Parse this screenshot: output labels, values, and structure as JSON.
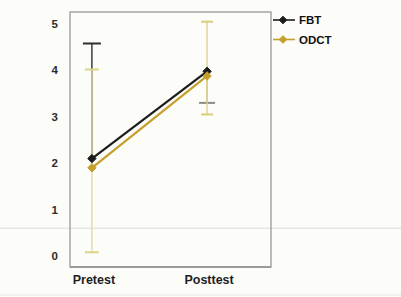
{
  "figure": {
    "kind": "scanned line chart with error bars",
    "background_color": "#fcfcf9",
    "plot_border_color": "#909090"
  },
  "chart_data": {
    "type": "line",
    "title": "",
    "xlabel": "",
    "ylabel": "",
    "categories": [
      "Pretest",
      "Posttest"
    ],
    "series": [
      {
        "name": "FBT",
        "color": "#1c1c1c",
        "marker": "diamond",
        "values": [
          2.1,
          3.98
        ]
      },
      {
        "name": "ODCT",
        "color": "#c49f2b",
        "marker": "diamond",
        "values": [
          1.9,
          3.88
        ]
      }
    ],
    "error_bars": [
      {
        "series": "FBT",
        "category_index": 0,
        "from": 2.1,
        "to": 4.58,
        "caps": [
          "to"
        ],
        "line_color": "#2e2e2e",
        "cap_color": "#2e2e2e",
        "cap_width": 18
      },
      {
        "series": "ODCT",
        "category_index": 0,
        "from": 0.08,
        "to": 4.02,
        "caps": [
          "from",
          "to"
        ],
        "line_color": "#e2db9e",
        "cap_color": "#ddd489",
        "cap_width": 14
      },
      {
        "series": "FBT",
        "category_index": 1,
        "from": 3.3,
        "to": 3.98,
        "caps": [
          "from"
        ],
        "line_color": "#bdb468",
        "cap_color": "#8a8a8a",
        "cap_width": 16
      },
      {
        "series": "ODCT",
        "category_index": 1,
        "from": 3.05,
        "to": 5.05,
        "caps": [
          "from",
          "to"
        ],
        "line_color": "#ddd48f",
        "cap_color": "#d8cf7e",
        "cap_width": 12
      }
    ],
    "ylim": [
      0,
      5
    ],
    "yticks": [
      0,
      1,
      2,
      3,
      4,
      5
    ],
    "grid": false,
    "legend": {
      "position": "top-right-outside",
      "entries": [
        "FBT",
        "ODCT"
      ]
    },
    "annotations": [
      {
        "name": "faint-horizontal-artifact-line",
        "y_value": 0.6,
        "color": "#dcdcd8",
        "full_width": true
      },
      {
        "name": "bottom-scan-smudge-line",
        "y_px": 295,
        "color": "#e6e6e2",
        "full_width": true
      }
    ],
    "layout_hints": {
      "category_x_fraction": [
        0.109,
        0.682
      ],
      "plot_px": {
        "left": 70,
        "top": 12,
        "width": 201,
        "height": 255
      },
      "value0_y_px": 256,
      "px_per_unit": 46.4
    }
  }
}
